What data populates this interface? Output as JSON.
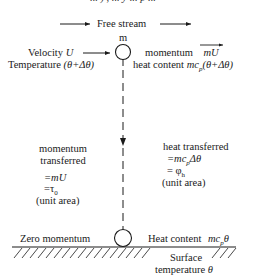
{
  "cropped_top_text": "... ) , ... y ... p ...",
  "header": {
    "free_stream_label": "Free stream"
  },
  "particle_top": {
    "mass_label": "m",
    "velocity_label": "Velocity",
    "velocity_symbol": "U",
    "temperature_label": "Temperature",
    "temperature_value": "(θ+Δθ)",
    "momentum_label": "momentum",
    "momentum_value": "mU",
    "heat_content_label": "heat content",
    "heat_content_value": "mc",
    "heat_content_sub": "p",
    "heat_content_tail": "(θ+Δθ)"
  },
  "left_panel": {
    "line1": "momentum",
    "line2": "transferred",
    "eq1": "=mU",
    "eq2": "=τ",
    "eq2_sub": "0",
    "note": "(unit area)"
  },
  "right_panel": {
    "line1": "heat transferred",
    "eq1": "=mc",
    "eq1_sub": "p",
    "eq1_tail": "Δθ",
    "eq2": "= φ",
    "eq2_sub": "h",
    "note": "(unit area)"
  },
  "surface": {
    "zero_momentum_label": "Zero momentum",
    "heat_content_label": "Heat content",
    "heat_content_value": "mc",
    "heat_content_sub": "p",
    "heat_content_tail": "θ",
    "surface_label": "Surface",
    "surface_temp_label": "temperature",
    "surface_temp_symbol": "θ"
  },
  "colors": {
    "ink": "#1a1a1a",
    "background": "#ffffff"
  }
}
